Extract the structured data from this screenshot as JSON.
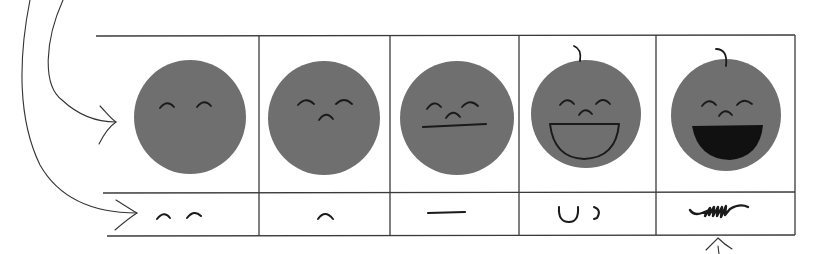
{
  "diagram": {
    "face_color": "#6f6f6f",
    "ink_color": "#1a1a1a",
    "line_color": "#3a3a3a",
    "background": "#ffffff",
    "columns": [
      {
        "index": 1,
        "face_features": [
          "closed-eyes"
        ],
        "feature_strip": "closed eyes",
        "has_hair_curl": false,
        "mouth": "none"
      },
      {
        "index": 2,
        "face_features": [
          "closed-eyes",
          "nose"
        ],
        "feature_strip": "nose",
        "has_hair_curl": false,
        "mouth": "none"
      },
      {
        "index": 3,
        "face_features": [
          "closed-eyes",
          "nose",
          "straight-mouth"
        ],
        "feature_strip": "straight mouth line",
        "has_hair_curl": false,
        "mouth": "straight line"
      },
      {
        "index": 4,
        "face_features": [
          "closed-eyes",
          "nose",
          "open-smile-outline",
          "hair-curl"
        ],
        "feature_strip": "open smile outline and hair curl",
        "has_hair_curl": true,
        "mouth": "open outline"
      },
      {
        "index": 5,
        "face_features": [
          "closed-eyes",
          "nose",
          "filled-open-mouth",
          "hair-curl"
        ],
        "feature_strip": "scribbled fill",
        "has_hair_curl": true,
        "mouth": "filled black"
      }
    ],
    "arrows": [
      {
        "name": "arrow-to-face-row",
        "target": "face row"
      },
      {
        "name": "arrow-to-feature-row",
        "target": "feature strip row"
      },
      {
        "name": "arrow-up-to-last-feature",
        "target": "last feature cell"
      }
    ]
  }
}
